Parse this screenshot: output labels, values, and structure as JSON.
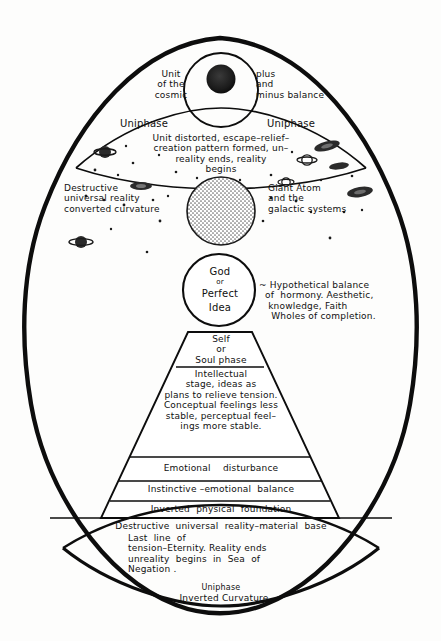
{
  "colors": {
    "ink": "#101010",
    "paper": "#fdfdfc",
    "stipple": "#cfcfcf",
    "core": "#1a1a1a"
  },
  "top_lens": {
    "core_label_left": "Unit\nof the\ncosmic",
    "core_label_right": "plus\nand\nminus balance",
    "uniphase_left": "Uniphase",
    "uniphase_right": "Uniphase",
    "body_text": "Unit distorted, escape–relief–\ncreation pattern formed, un–\nreality ends, reality\nbegins"
  },
  "middle": {
    "left_caption": "Destructive\nuniversal reality\nconverted curvature",
    "right_caption": "Giant Atom\nand the\ngalactic systems",
    "giant_atom_name": "giant-atom-sphere"
  },
  "god_circle": {
    "line1": "God",
    "line2": "or",
    "line3": "Perfect",
    "line4": "Idea",
    "annotation": "~ Hypothetical balance\n  of  hormony. Aesthetic,\n   knowledge, Faith\n    Wholes of completion."
  },
  "pyramid": {
    "apex_band": "Self\nor\nSoul phase",
    "band_intellectual": "Intellectual\nstage, ideas as\nplans to relieve tension.\nConceptual feelings less\nstable, perceptual feel–\nings more stable.",
    "band_emotional": "Emotional    disturbance",
    "band_instinctive": "Instinctive –emotional  balance",
    "band_inverted": "Inverted  physical  foundation"
  },
  "base_line": "Destructive  universal  reality–material  base",
  "bottom_lens": {
    "text": "Last  line  of\ntension–Eternity. Reality ends\nunreality  begins  in  Sea  of\nNegation .",
    "uniphase": "Uniphase",
    "inverted_curvature": "Inverted Curvature"
  }
}
